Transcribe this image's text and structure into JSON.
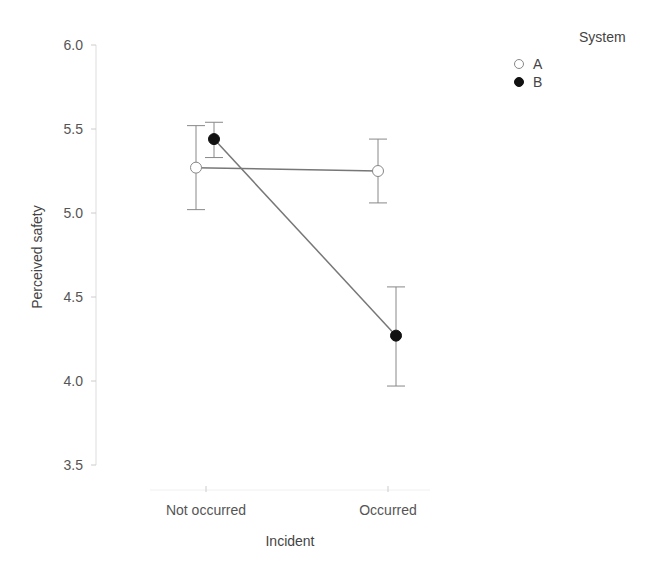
{
  "chart_data": {
    "type": "line",
    "title": "",
    "xlabel": "Incident",
    "ylabel": "Perceived safety",
    "categories": [
      "Not occurred",
      "Occurred"
    ],
    "ylim": [
      3.4,
      6.0
    ],
    "yticks": [
      3.5,
      4.0,
      4.5,
      5.0,
      5.5,
      6.0
    ],
    "ytick_labels": [
      "3.5",
      "4.0",
      "4.5",
      "5.0",
      "5.5",
      "6.0"
    ],
    "grid": false,
    "legend": {
      "title": "System",
      "position": "top-right"
    },
    "series": [
      {
        "name": "A",
        "marker": "open-circle",
        "values": [
          5.27,
          5.25
        ],
        "error_upper": [
          5.52,
          5.44
        ],
        "error_lower": [
          5.02,
          5.06
        ]
      },
      {
        "name": "B",
        "marker": "filled-circle",
        "values": [
          5.44,
          4.27
        ],
        "error_upper": [
          5.54,
          4.56
        ],
        "error_lower": [
          5.33,
          3.97
        ]
      }
    ]
  },
  "colors": {
    "line": "#777777",
    "marker_filled": "#111111",
    "marker_open_fill": "#ffffff",
    "marker_open_stroke": "#888888",
    "axis": "#dddddd"
  }
}
